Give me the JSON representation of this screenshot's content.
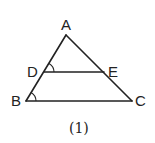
{
  "figure": {
    "caption": "(1)",
    "points": {
      "A": {
        "label": "A"
      },
      "B": {
        "label": "B"
      },
      "C": {
        "label": "C"
      },
      "D": {
        "label": "D"
      },
      "E": {
        "label": "E"
      }
    },
    "segments": [
      "AB",
      "AC",
      "BC",
      "DE"
    ],
    "angle_marks": [
      "ADE",
      "ABC"
    ],
    "stroke_color": "#222222"
  }
}
